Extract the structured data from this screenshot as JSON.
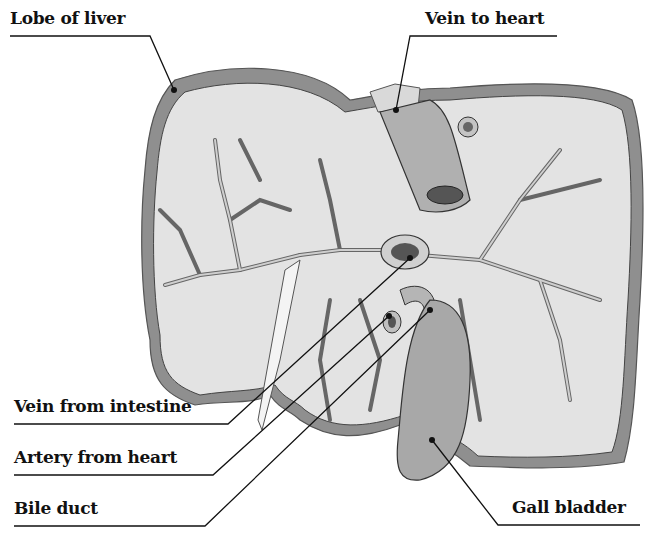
{
  "diagram": {
    "labels": {
      "lobe_of_liver": "Lobe of liver",
      "vein_to_heart": "Vein to heart",
      "vein_from_intestine": "Vein from intestine",
      "artery_from_heart": "Artery from heart",
      "bile_duct": "Bile duct",
      "gall_bladder": "Gall bladder"
    },
    "colors": {
      "ink": "#111111",
      "liver_rim": "#8a8a8a",
      "liver_tissue": "#e2e2e2",
      "vessel": "#b5b5b5",
      "vessel_lumen": "#555555",
      "gall_bladder": "#a8a8a8"
    }
  }
}
